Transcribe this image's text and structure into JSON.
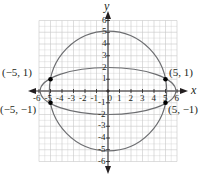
{
  "chart_data": {
    "type": "scatter",
    "title": "",
    "xlabel": "x",
    "ylabel": "y",
    "xlim": [
      -6,
      6
    ],
    "ylim": [
      -6,
      6
    ],
    "grid": true,
    "x_ticks": [
      "-6",
      "-5",
      "-4",
      "-3",
      "-2",
      "-1",
      "0",
      "1",
      "2",
      "3",
      "4",
      "5",
      "6"
    ],
    "y_ticks": [
      "-6",
      "-5",
      "-4",
      "-3",
      "-2",
      "-1",
      "1",
      "2",
      "3",
      "4",
      "5",
      "6"
    ],
    "curves": [
      {
        "name": "circle",
        "shape": "circle",
        "center": [
          0,
          0
        ],
        "radius": 5.1,
        "equation_hint": "x^2 + y^2 = 26"
      },
      {
        "name": "ellipse",
        "shape": "ellipse",
        "center": [
          0,
          0
        ],
        "semi_axis_x": 5.9,
        "semi_axis_y": 2.0
      }
    ],
    "points": [
      {
        "x": -5,
        "y": 1,
        "label": "(−5, 1)"
      },
      {
        "x": 5,
        "y": 1,
        "label": "(5, 1)"
      },
      {
        "x": -5,
        "y": -1,
        "label": "(−5, −1)"
      },
      {
        "x": 5,
        "y": -1,
        "label": "(5, −1)"
      }
    ],
    "colors": {
      "curve": "#6d6e71",
      "grid": "#c8c8c8",
      "axis": "#231f20",
      "point": "#000000"
    }
  }
}
